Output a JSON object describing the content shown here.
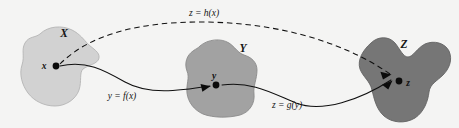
{
  "figure": {
    "kind": "function-composition-diagram",
    "caption_text": "",
    "background_color": "#f4f4f3"
  },
  "sets": [
    {
      "id": "X",
      "label": "X",
      "fill_color": "#d2d2d2",
      "stroke_color": "#b4b4b4",
      "label_x": 64,
      "label_y": 37
    },
    {
      "id": "Y",
      "label": "Y",
      "fill_color": "#a2a2a2",
      "stroke_color": "#8a8a8a",
      "label_x": 243,
      "label_y": 52
    },
    {
      "id": "Z",
      "label": "Z",
      "fill_color": "#767676",
      "stroke_color": "#636363",
      "label_x": 404,
      "label_y": 48
    }
  ],
  "points": [
    {
      "id": "x",
      "label": "x",
      "cx": 56,
      "cy": 66,
      "label_x": 44,
      "label_y": 68
    },
    {
      "id": "y",
      "label": "y",
      "cx": 216,
      "cy": 85,
      "label_x": 214,
      "label_y": 79
    },
    {
      "id": "z",
      "label": "z",
      "cx": 399,
      "cy": 81,
      "label_x": 407,
      "label_y": 86
    }
  ],
  "mappings": [
    {
      "id": "f",
      "label": "y = f(x)",
      "style": "solid",
      "from": "x",
      "to": "y",
      "label_x": 122,
      "label_y": 99
    },
    {
      "id": "g",
      "label": "z = g(y)",
      "style": "solid",
      "from": "y",
      "to": "z",
      "label_x": 287,
      "label_y": 108
    },
    {
      "id": "h",
      "label": "z = h(x)",
      "style": "dashed",
      "from": "x",
      "to": "z",
      "label_x": 204,
      "label_y": 16
    }
  ]
}
